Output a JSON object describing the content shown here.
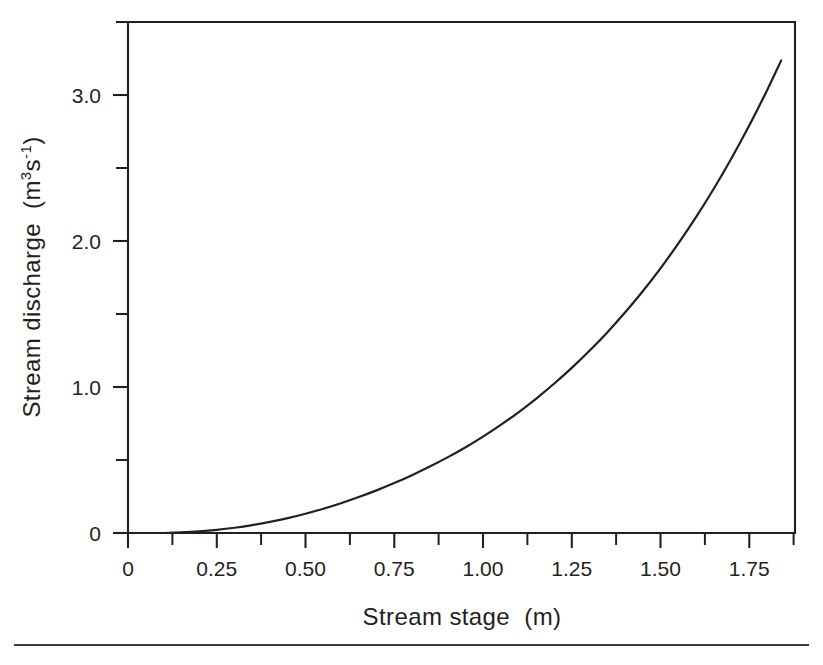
{
  "figure": {
    "background_color": "#ffffff",
    "ink_color": "#231f20",
    "footer_rule_color": "#3b3b3b"
  },
  "axes": {
    "x": {
      "title_main": "Stream stage",
      "title_units": "(m)",
      "tick_labels": [
        "0",
        "0.25",
        "0.50",
        "0.75",
        "1.00",
        "1.25",
        "1.50",
        "1.75"
      ],
      "tick_values": [
        0,
        0.25,
        0.5,
        0.75,
        1.0,
        1.25,
        1.5,
        1.75
      ],
      "minor_tick_values": [
        0.125,
        0.375,
        0.625,
        0.875,
        1.125,
        1.375,
        1.625,
        1.875
      ],
      "range": [
        0,
        1.88
      ]
    },
    "y": {
      "title_main": "Stream discharge",
      "title_units_open": "(m",
      "title_units_sup1": "3",
      "title_units_s": "s",
      "title_units_sup2": "-1",
      "title_units_close": ")",
      "title_plain": "Stream discharge  (m3s-1)",
      "tick_labels": [
        "0",
        "1.0",
        "2.0",
        "3.0"
      ],
      "tick_values": [
        0,
        1.0,
        2.0,
        3.0
      ],
      "minor_tick_values": [
        0.5,
        1.5,
        2.5,
        3.5
      ],
      "range": [
        0,
        3.5
      ]
    }
  },
  "chart_data": {
    "type": "line",
    "title": "",
    "xlabel": "Stream stage  (m)",
    "ylabel": "Stream discharge  (m3s-1)",
    "xlim": [
      0,
      1.88
    ],
    "ylim": [
      0,
      3.5
    ],
    "grid": false,
    "legend": "none",
    "series": [
      {
        "name": "Stage-discharge rating curve",
        "x": [
          0.1,
          0.15,
          0.2,
          0.25,
          0.3,
          0.35,
          0.4,
          0.45,
          0.5,
          0.55,
          0.6,
          0.65,
          0.7,
          0.75,
          0.8,
          0.85,
          0.9,
          0.95,
          1.0,
          1.05,
          1.1,
          1.15,
          1.2,
          1.25,
          1.3,
          1.35,
          1.4,
          1.45,
          1.5,
          1.55,
          1.6,
          1.65,
          1.7,
          1.75,
          1.8,
          1.84
        ],
        "y": [
          0.0,
          0.005,
          0.012,
          0.022,
          0.036,
          0.054,
          0.076,
          0.102,
          0.132,
          0.166,
          0.204,
          0.246,
          0.292,
          0.342,
          0.396,
          0.455,
          0.518,
          0.586,
          0.66,
          0.74,
          0.827,
          0.921,
          1.022,
          1.131,
          1.248,
          1.374,
          1.51,
          1.656,
          1.813,
          1.982,
          2.163,
          2.358,
          2.567,
          2.791,
          3.031,
          3.237
        ]
      }
    ],
    "annotations": []
  }
}
